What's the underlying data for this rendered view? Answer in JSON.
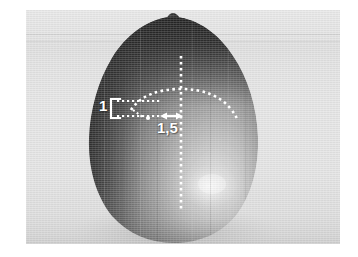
{
  "figure": {
    "kind": "photograph-with-measurement-annotations",
    "subject_name": "seed-specimen",
    "background_color": "#e4e4e4",
    "page_color": "#ffffff",
    "annotation_color": "#ffffff"
  },
  "annotations": {
    "labels": [
      {
        "id": "height-ratio",
        "text": "1",
        "name": "measurement-label-1",
        "role": "vertical-extent-of-apex-curve"
      },
      {
        "id": "width-ratio",
        "text": "1,5",
        "name": "measurement-label-1-5",
        "role": "horizontal-offset-from-axis"
      }
    ],
    "guides": [
      {
        "id": "apex-arc",
        "name": "apex-curvature-arc",
        "style": "dotted",
        "description": "dotted arc tracing the curvature of the specimen apex"
      },
      {
        "id": "major-axis",
        "name": "vertical-axis-dotted-line",
        "style": "dotted",
        "description": "vertical dotted centre axis from apex downwards"
      },
      {
        "id": "bracket-1",
        "name": "height-bracket",
        "style": "solid",
        "description": "square bracket marking the unit height 1"
      },
      {
        "id": "arrow-1-5",
        "name": "double-headed-arrow",
        "style": "solid",
        "description": "double headed horizontal arrow marking 1,5"
      },
      {
        "id": "upper-tie",
        "name": "upper-dotted-tie-line",
        "style": "dotted"
      },
      {
        "id": "lower-tie",
        "name": "lower-dotted-tie-line",
        "style": "dotted"
      },
      {
        "id": "diagonal-tie",
        "name": "diagonal-dotted-tie-line",
        "style": "dotted"
      }
    ]
  },
  "specimen": {
    "colors": {
      "dark_shadow": "#1b1b1b",
      "mid_tone": "#6d6d6d",
      "light_tone": "#c9c9c9",
      "highlight": "#efefef",
      "stem": "#141414"
    },
    "parts": [
      {
        "name": "stem-nub",
        "label": "stem nub at apex"
      },
      {
        "name": "body",
        "label": "ovoid body"
      },
      {
        "name": "specular-highlight",
        "label": "specular highlight lower right"
      }
    ]
  }
}
